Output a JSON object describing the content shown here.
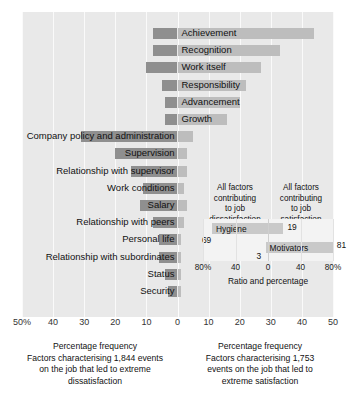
{
  "chart_data": {
    "type": "bar",
    "title": "",
    "xlabel": "Percentage frequency",
    "orientation": "horizontal-diverging",
    "axis": {
      "ticks": [
        "50%",
        "40",
        "30",
        "20",
        "10",
        "0",
        "10",
        "20",
        "30",
        "40",
        "50"
      ],
      "tick_values": [
        -50,
        -40,
        -30,
        -20,
        -10,
        0,
        10,
        20,
        30,
        40,
        50
      ],
      "xlim": [
        -50,
        50
      ],
      "grid": true,
      "zero_at": 0
    },
    "categories": [
      "Achievement",
      "Recognition",
      "Work itself",
      "Responsibility",
      "Advancement",
      "Growth",
      "Company policy and administration",
      "Supervision",
      "Relationship with supervisor",
      "Work conditions",
      "Salary",
      "Relationship with peers",
      "Personal life",
      "Relationship with subordinates",
      "Status",
      "Security"
    ],
    "series": [
      {
        "name": "Factors leading to extreme dissatisfaction",
        "side": "left",
        "color": "#8f8f8f",
        "values": [
          8,
          8,
          10,
          5,
          4,
          4,
          31,
          20,
          15,
          11,
          12,
          8,
          6,
          6,
          4,
          3
        ]
      },
      {
        "name": "Factors leading to extreme satisfaction",
        "side": "right",
        "color": "#bdbdbd",
        "values": [
          44,
          33,
          27,
          22,
          20,
          16,
          5,
          3,
          3,
          2,
          3,
          2,
          1,
          1,
          1,
          1
        ]
      }
    ],
    "bars": [
      {
        "label": "Achievement",
        "left": 8,
        "right": 44,
        "label_side": "right"
      },
      {
        "label": "Recognition",
        "left": 8,
        "right": 33,
        "label_side": "right"
      },
      {
        "label": "Work itself",
        "left": 10,
        "right": 27,
        "label_side": "right"
      },
      {
        "label": "Responsibility",
        "left": 5,
        "right": 22,
        "label_side": "right"
      },
      {
        "label": "Advancement",
        "left": 4,
        "right": 20,
        "label_side": "right"
      },
      {
        "label": "Growth",
        "left": 4,
        "right": 16,
        "label_side": "right"
      },
      {
        "label": "Company policy and administration",
        "left": 31,
        "right": 5,
        "label_side": "left"
      },
      {
        "label": "Supervision",
        "left": 20,
        "right": 3,
        "label_side": "left"
      },
      {
        "label": "Relationship with supervisor",
        "left": 15,
        "right": 3,
        "label_side": "left"
      },
      {
        "label": "Work conditions",
        "left": 11,
        "right": 2,
        "label_side": "left"
      },
      {
        "label": "Salary",
        "left": 12,
        "right": 3,
        "label_side": "left"
      },
      {
        "label": "Relationship with peers",
        "left": 8,
        "right": 2,
        "label_side": "left"
      },
      {
        "label": "Personal life",
        "left": 6,
        "right": 1,
        "label_side": "left"
      },
      {
        "label": "Relationship with subordinates",
        "left": 6,
        "right": 1,
        "label_side": "left"
      },
      {
        "label": "Status",
        "left": 4,
        "right": 1,
        "label_side": "left"
      },
      {
        "label": "Security",
        "left": 3,
        "right": 1,
        "label_side": "left"
      }
    ],
    "caption_left": "Percentage frequency Factors characterising 1,844 events on the job that led to extreme dissatisfaction",
    "caption_right": "Percentage frequency Factors characterising 1,753 events on the job that led to extreme satisfaction",
    "inset": {
      "type": "bar",
      "heading_left": "All factors contributing to job dissatisfaction",
      "heading_right": "All factors contributing to job satisfaction",
      "axis_title": "Ratio and percentage",
      "ticks": [
        "80%",
        "40",
        "0",
        "40",
        "80%"
      ],
      "tick_values": [
        -80,
        -40,
        0,
        40,
        80
      ],
      "xlim": [
        -80,
        80
      ],
      "categories": [
        "Hygiene",
        "Motivators"
      ],
      "values_left": [
        69,
        19
      ],
      "values_right": [
        31,
        81
      ],
      "series": [
        {
          "name": "Hygiene",
          "dissatisfaction": 69,
          "satisfaction": 19
        },
        {
          "name": "Motivators",
          "dissatisfaction": 3,
          "satisfaction": 81
        }
      ]
    }
  },
  "axis": {
    "t0": "50%",
    "t1": "40",
    "t2": "30",
    "t3": "20",
    "t4": "10",
    "t5": "0",
    "t6": "10",
    "t7": "20",
    "t8": "30",
    "t9": "40",
    "t10": "50"
  },
  "captions": {
    "left_line1": "Percentage frequency",
    "left_line2": "Factors characterising 1,844 events",
    "left_line3": "on the job that led to extreme",
    "left_line4": "dissatisfaction",
    "right_line1": "Percentage frequency",
    "right_line2": "Factors characterising 1,753",
    "right_line3": "events on the job that led to",
    "right_line4": "extreme satisfaction"
  },
  "inset": {
    "head_left_l1": "All factors",
    "head_left_l2": "contributing",
    "head_left_l3": "to job",
    "head_left_l4": "dissatisfaction",
    "head_right_l1": "All factors",
    "head_right_l2": "contributing",
    "head_right_l3": "to job",
    "head_right_l4": "satisfaction",
    "hygiene_label": "Hygiene",
    "hygiene_left_value": "69",
    "hygiene_right_value": "19",
    "motivators_label": "Motivators",
    "motivators_left_value": "3",
    "motivators_right_value": "81",
    "tick0": "80%",
    "tick1": "40",
    "tick2": "0",
    "tick3": "40",
    "tick4": "80%",
    "axis_title": "Ratio and percentage"
  },
  "colors": {
    "panel_bg": "#e9e9e9",
    "bar_dark": "#8f8f8f",
    "bar_light": "#bdbdbd",
    "inset_bar": "#c9c9c9",
    "gridline": "#fafafa"
  }
}
